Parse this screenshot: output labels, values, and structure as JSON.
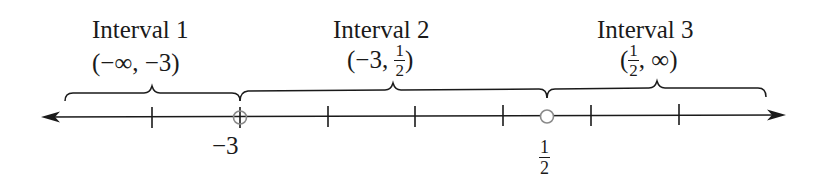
{
  "intervals": [
    {
      "title": "Interval 1",
      "notation": {
        "open": "(",
        "left": "−∞",
        "sep": ", ",
        "right": "−3",
        "close": ")"
      }
    },
    {
      "title": "Interval 2",
      "notation": {
        "open": "(",
        "left": "−3",
        "sep": ", ",
        "right_num": "1",
        "right_den": "2",
        "close": ")"
      }
    },
    {
      "title": "Interval 3",
      "notation": {
        "open": "(",
        "left_num": "1",
        "left_den": "2",
        "sep": ", ",
        "right": "∞",
        "close": ")"
      }
    }
  ],
  "number_line": {
    "points": [
      {
        "label": "−3",
        "type": "open-circle"
      },
      {
        "label_num": "1",
        "label_den": "2",
        "type": "open-circle"
      }
    ],
    "tick_count": 7,
    "arrows": [
      "left",
      "right"
    ]
  },
  "colors": {
    "ink": "#1a1a1a",
    "circle": "#8a8a8a",
    "background": "#ffffff"
  }
}
